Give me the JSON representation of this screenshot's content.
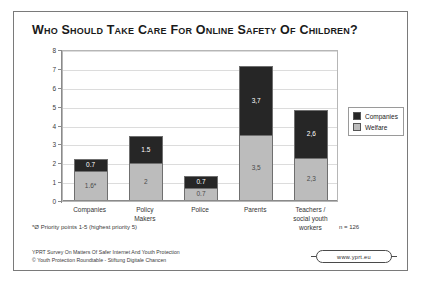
{
  "slide": {
    "title": "Who Should Take Care For Online Safety Of Children?",
    "footnote": "*Ø Priority points 1-5 (highest priority 5)",
    "sample_size": "n = 126",
    "source_line_1": "YPRT Survey On Matters Of Safer Internet And Youth Protection",
    "source_line_2": "© Youth Protection Roundtable - Stiftung Digitale Chancen",
    "logo_text": "www.yprt.eu"
  },
  "colors": {
    "companies": "#262626",
    "welfare": "#bcbcbc",
    "frame": "#7a7a7a",
    "grid": "#dcdcdc",
    "axis": "#8a8a8a"
  },
  "chart_data": {
    "type": "bar",
    "subtype": "stacked",
    "title": "Who Should Take Care For Online Safety Of Children?",
    "xlabel": "",
    "ylabel": "",
    "ylim": [
      0,
      8
    ],
    "yticks": [
      "0",
      "1",
      "2",
      "3",
      "4",
      "5",
      "6",
      "7",
      "8"
    ],
    "grid": true,
    "legend_position": "right",
    "categories": [
      "Companies",
      "Policy Makers",
      "Police",
      "Parents",
      "Teachers / social youth workers"
    ],
    "category_labels": [
      [
        "Companies"
      ],
      [
        "Policy",
        "Makers"
      ],
      [
        "Police"
      ],
      [
        "Parents"
      ],
      [
        "Teachers /",
        "social youth",
        "workers"
      ]
    ],
    "series": [
      {
        "name": "Welfare",
        "color": "#bcbcbc",
        "values": [
          1.6,
          2,
          0.7,
          3.5,
          2.3
        ],
        "labels": [
          "1.6*",
          "2",
          "0.7",
          "3,5",
          "2,3"
        ]
      },
      {
        "name": "Companies",
        "color": "#262626",
        "values": [
          0.7,
          1.5,
          0.7,
          3.7,
          2.6
        ],
        "labels": [
          "0.7",
          "1.5",
          "0.7",
          "3,7",
          "2,6"
        ]
      }
    ],
    "totals": [
      2.3,
      3.5,
      1.4,
      7.2,
      4.9
    ],
    "annotations": [
      "*Ø Priority points 1-5 (highest priority 5)",
      "n = 126"
    ]
  },
  "legend": {
    "items": [
      {
        "label": "Companies",
        "swatch": "#262626"
      },
      {
        "label": "Welfare",
        "swatch": "#bcbcbc"
      }
    ]
  }
}
